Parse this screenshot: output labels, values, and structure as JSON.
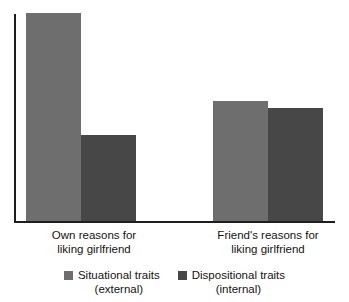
{
  "chart_data": {
    "type": "bar",
    "title": "",
    "subtitle": "",
    "xlabel": "",
    "ylabel": "",
    "grid": false,
    "legend_position": "bottom",
    "ylim": [
      0,
      100
    ],
    "y_axis_visible": true,
    "y_ticks": [],
    "categories": [
      "Own reasons for\nliking girlfriend",
      "Friend's reasons for\nliking girlfriend"
    ],
    "series": [
      {
        "name": "Situational traits\n(external)",
        "color": "#6e6e6e",
        "values": [
          97,
          56
        ]
      },
      {
        "name": "Dispositional traits\n(internal)",
        "color": "#474747",
        "values": [
          40,
          53
        ]
      }
    ],
    "annotations": []
  },
  "legend": {
    "items": [
      {
        "label": "Situational traits\n(external)",
        "color": "#6e6e6e"
      },
      {
        "label": "Dispositional traits\n(internal)",
        "color": "#474747"
      }
    ]
  },
  "axis": {
    "line_color": "#1e1e1e"
  }
}
